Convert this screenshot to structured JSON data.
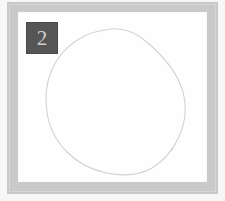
{
  "panel": {
    "width": 225,
    "height": 201,
    "outer_margin_color": "#f7f7f7",
    "frame_color": "#c9c9c9",
    "canvas_color": "#fefefe"
  },
  "badge": {
    "label": "2",
    "background_color": "#555555",
    "text_color": "#cfcfcf",
    "size_px": 32
  },
  "drawing": {
    "name": "hand-drawn-circle",
    "stroke_color": "#d2d2d2",
    "stroke_width": 1.1,
    "fill": "none",
    "description": "freehand irregular closed circle",
    "path": "M 87 18 C 103 14 118 20 130 31 C 145 44 157 58 163 74 C 169 90 168 106 163 120 C 157 135 147 148 134 156 C 120 164 104 164 89 161 C 74 158 60 151 49 140 C 38 129 31 115 29 100 C 27 86 28 72 33 60 C 39 45 50 33 63 26 C 71 21 79 19 87 18 Z",
    "tail_path": "M 149 143 C 151 141 153 139 155 137"
  }
}
